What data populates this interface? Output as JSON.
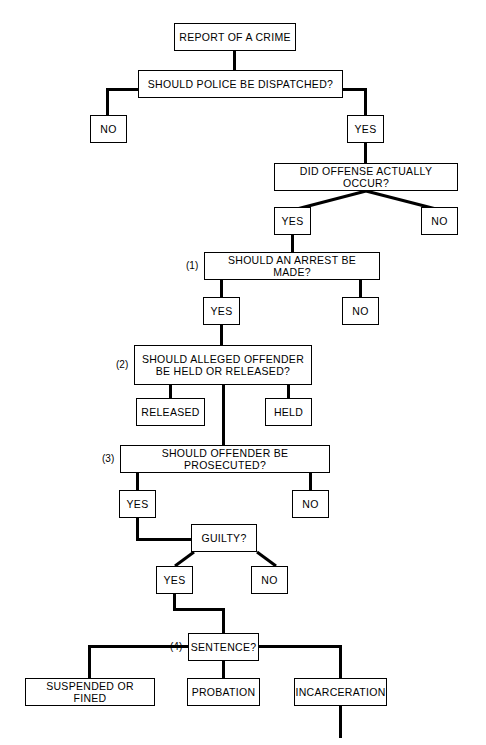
{
  "diagram": {
    "line_color": "#000000",
    "box_fill": "#ffffff",
    "nodes": {
      "report": {
        "label": "REPORT OF A CRIME"
      },
      "dispatch": {
        "label": "SHOULD POLICE BE DISPATCHED?"
      },
      "dispatch_no": {
        "label": "NO"
      },
      "dispatch_yes": {
        "label": "YES"
      },
      "offense": {
        "label": "DID OFFENSE ACTUALLY OCCUR?"
      },
      "offense_yes": {
        "label": "YES"
      },
      "offense_no": {
        "label": "NO"
      },
      "arrest": {
        "label": "SHOULD AN ARREST BE MADE?",
        "tag": "(1)"
      },
      "arrest_yes": {
        "label": "YES"
      },
      "arrest_no": {
        "label": "NO"
      },
      "held_released": {
        "label": "SHOULD ALLEGED OFFENDER\nBE HELD OR RELEASED?",
        "tag": "(2)"
      },
      "released": {
        "label": "RELEASED"
      },
      "held": {
        "label": "HELD"
      },
      "prosecute": {
        "label": "SHOULD OFFENDER BE PROSECUTED?",
        "tag": "(3)"
      },
      "prosecute_yes": {
        "label": "YES"
      },
      "prosecute_no": {
        "label": "NO"
      },
      "guilty": {
        "label": "GUILTY?"
      },
      "guilty_yes": {
        "label": "YES"
      },
      "guilty_no": {
        "label": "NO"
      },
      "sentence": {
        "label": "SENTENCE?",
        "tag": "(4)"
      },
      "suspended": {
        "label": "SUSPENDED OR FINED"
      },
      "probation": {
        "label": "PROBATION"
      },
      "incarceration": {
        "label": "INCARCERATION"
      }
    }
  }
}
